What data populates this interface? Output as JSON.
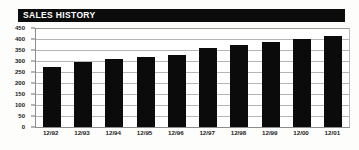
{
  "title": "SALES HISTORY",
  "colors": {
    "title_bar_background": "#0c0c0c",
    "title_text": "#ffffff",
    "bar": "#0b0b0b",
    "gridline": "#b5b5b5",
    "axis": "#8c8c8c",
    "page_background": "#fdfdfb",
    "plot_background": "#ffffff"
  },
  "chart_data": {
    "type": "bar",
    "title": "SALES HISTORY",
    "xlabel": "",
    "ylabel": "",
    "categories": [
      "12/92",
      "12/93",
      "12/94",
      "12/95",
      "12/96",
      "12/97",
      "12/98",
      "12/99",
      "12/00",
      "12/01"
    ],
    "values": [
      275,
      297,
      308,
      318,
      326,
      360,
      371,
      388,
      400,
      413
    ],
    "ylim": [
      0,
      450
    ],
    "ytick_values": [
      0,
      50,
      100,
      150,
      200,
      250,
      300,
      350,
      400,
      450
    ],
    "ytick_labels": [
      "0",
      "50",
      "100",
      "150",
      "200",
      "250",
      "300",
      "350",
      "400",
      "450"
    ],
    "grid": true,
    "grid_axis": "y",
    "legend": false,
    "legend_position": "none",
    "bar_color": "#0b0b0b",
    "series": [
      {
        "name": "Sales",
        "values": [
          275,
          297,
          308,
          318,
          326,
          360,
          371,
          388,
          400,
          413
        ]
      }
    ]
  }
}
